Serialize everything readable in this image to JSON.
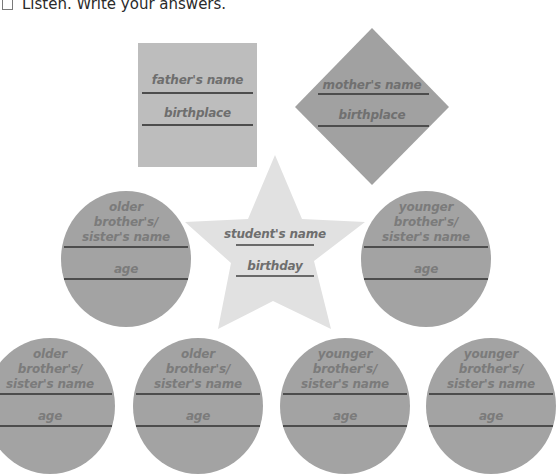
{
  "instruction": {
    "icon": "checkbox-icon",
    "text": "Listen. Write your answers."
  },
  "colors": {
    "square_fill": "#bdbdbd",
    "diamond_fill": "#a1a1a1",
    "star_fill": "#e1e1e1",
    "circle_fill": "#a3a3a3",
    "label_text": "#6e6e6e",
    "rule_line": "#4d4d4d"
  },
  "father": {
    "name_label": "father's name",
    "second_label": "birthplace"
  },
  "mother": {
    "name_label": "mother's name",
    "second_label": "birthplace"
  },
  "student": {
    "name_label": "student's name",
    "second_label": "birthday"
  },
  "siblings": [
    {
      "line1": "older",
      "line2": "brother's/",
      "line3": "sister's name",
      "age_label": "age"
    },
    {
      "line1": "younger",
      "line2": "brother's/",
      "line3": "sister's name",
      "age_label": "age"
    },
    {
      "line1": "older",
      "line2": "brother's/",
      "line3": "sister's name",
      "age_label": "age"
    },
    {
      "line1": "older",
      "line2": "brother's/",
      "line3": "sister's name",
      "age_label": "age"
    },
    {
      "line1": "younger",
      "line2": "brother's/",
      "line3": "sister's name",
      "age_label": "age"
    },
    {
      "line1": "younger",
      "line2": "brother's/",
      "line3": "sister's name",
      "age_label": "age"
    }
  ]
}
